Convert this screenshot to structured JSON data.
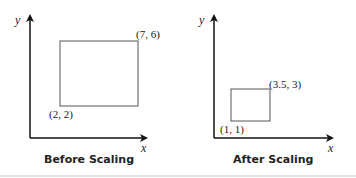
{
  "panels": [
    {
      "caption": "Before Scaling",
      "y_label": "y",
      "x_label": "x",
      "bottom_left_label": "(2, 2)",
      "top_right_label": "(7, 6)"
    },
    {
      "caption": "After Scaling",
      "y_label": "y",
      "x_label": "x",
      "bottom_left_label": "(1, 1)",
      "top_right_label": "(3.5, 3)"
    }
  ],
  "colors": {
    "axis": "#111111",
    "rect": "#555555",
    "bottom_rule": "#dddddd"
  }
}
